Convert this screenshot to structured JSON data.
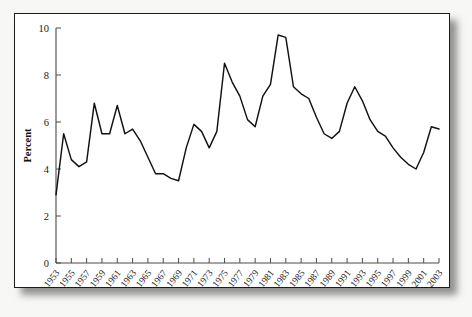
{
  "chart_data": {
    "type": "line",
    "title": "",
    "subtitle": "",
    "xlabel": "",
    "ylabel": "Percent",
    "xlim": [
      1953,
      2003
    ],
    "ylim": [
      0,
      10
    ],
    "grid": false,
    "legend": null,
    "y_ticks": [
      0,
      2,
      4,
      6,
      8,
      10
    ],
    "y_tick_labels": [
      "0",
      "2",
      "4",
      "6",
      "8",
      "10"
    ],
    "x_tick_step": 2,
    "x_tick_labels": [
      "1953",
      "1955",
      "1957",
      "1959",
      "1961",
      "1963",
      "1965",
      "1967",
      "1969",
      "1971",
      "1973",
      "1975",
      "1977",
      "1979",
      "1981",
      "1983",
      "1985",
      "1987",
      "1989",
      "1991",
      "1993",
      "1995",
      "1997",
      "1999",
      "2001",
      "2003"
    ],
    "x": [
      1953,
      1954,
      1955,
      1956,
      1957,
      1958,
      1959,
      1960,
      1961,
      1962,
      1963,
      1964,
      1965,
      1966,
      1967,
      1968,
      1969,
      1970,
      1971,
      1972,
      1973,
      1974,
      1975,
      1976,
      1977,
      1978,
      1979,
      1980,
      1981,
      1982,
      1983,
      1984,
      1985,
      1986,
      1987,
      1988,
      1989,
      1990,
      1991,
      1992,
      1993,
      1994,
      1995,
      1996,
      1997,
      1998,
      1999,
      2000,
      2001,
      2002,
      2003
    ],
    "values": [
      2.9,
      5.5,
      4.4,
      4.1,
      4.3,
      6.8,
      5.5,
      5.5,
      6.7,
      5.5,
      5.7,
      5.2,
      4.5,
      3.8,
      3.8,
      3.6,
      3.5,
      4.9,
      5.9,
      5.6,
      4.9,
      5.6,
      8.5,
      7.7,
      7.1,
      6.1,
      5.8,
      7.1,
      7.6,
      9.7,
      9.6,
      7.5,
      7.2,
      7.0,
      6.2,
      5.5,
      5.3,
      5.6,
      6.8,
      7.5,
      6.9,
      6.1,
      5.6,
      5.4,
      4.9,
      4.5,
      4.2,
      4.0,
      4.7,
      5.8,
      5.7
    ]
  },
  "figure": {
    "y_axis_title": "Percent"
  }
}
